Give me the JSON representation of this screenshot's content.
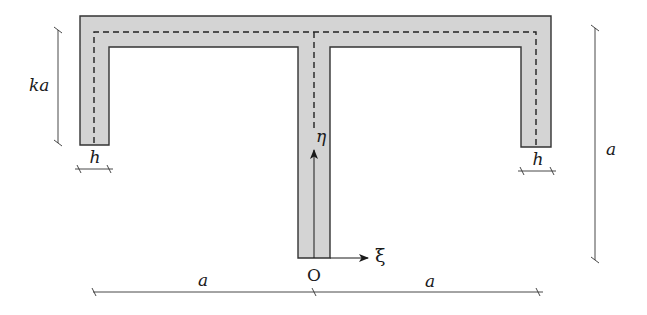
{
  "diagram": {
    "type": "cross-section",
    "colors": {
      "fill": "#d4d4d4",
      "stroke": "#333333",
      "centerline": "#222222",
      "dimension": "#333333"
    },
    "labels": {
      "flange_depth": "ka",
      "thickness_left": "h",
      "thickness_right": "h",
      "height": "a",
      "half_width_left": "a",
      "half_width_right": "a",
      "origin": "O",
      "axis_horizontal": "ξ",
      "axis_vertical": "η"
    }
  }
}
